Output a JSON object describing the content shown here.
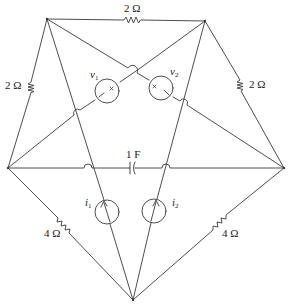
{
  "diagram": {
    "type": "circuit-schematic",
    "colors": {
      "wire": "#3a3a3a",
      "background": "#ffffff",
      "text": "#222222"
    },
    "nodes": [
      {
        "id": "A",
        "position": "top-left"
      },
      {
        "id": "B",
        "position": "top-right"
      },
      {
        "id": "C",
        "position": "left"
      },
      {
        "id": "D",
        "position": "right"
      },
      {
        "id": "E",
        "position": "bottom"
      }
    ],
    "components": {
      "r_top": {
        "type": "resistor",
        "label": "2 Ω",
        "between": [
          "A",
          "B"
        ]
      },
      "r_left": {
        "type": "resistor",
        "label": "2 Ω",
        "between": [
          "A",
          "C"
        ]
      },
      "r_right": {
        "type": "resistor",
        "label": "2 Ω",
        "between": [
          "B",
          "D"
        ]
      },
      "r_bottom_left": {
        "type": "resistor",
        "label": "4 Ω",
        "between": [
          "C",
          "E"
        ]
      },
      "r_bottom_right": {
        "type": "resistor",
        "label": "4 Ω",
        "between": [
          "D",
          "E"
        ]
      },
      "cap": {
        "type": "capacitor",
        "label": "1 F",
        "between": [
          "C",
          "D"
        ]
      },
      "v1": {
        "type": "voltage-source",
        "symbol": "v",
        "subscript": "1",
        "between": [
          "B",
          "C"
        ]
      },
      "v2": {
        "type": "voltage-source",
        "symbol": "v",
        "subscript": "2",
        "between": [
          "A",
          "D"
        ]
      },
      "i1": {
        "type": "current-source",
        "symbol": "i",
        "subscript": "1",
        "between": [
          "E",
          "A"
        ]
      },
      "i2": {
        "type": "current-source",
        "symbol": "i",
        "subscript": "2",
        "between": [
          "E",
          "B"
        ]
      }
    }
  }
}
